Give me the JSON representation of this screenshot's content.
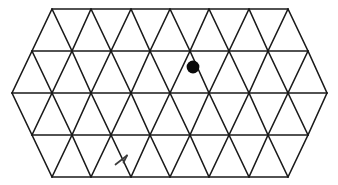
{
  "figure": {
    "background_color": "#ffffff",
    "line_color": "#1a1a1a",
    "line_width": 1.6,
    "marker_color": "#000000",
    "annotation_color": "#3a3a3a"
  },
  "geometry": {
    "width": 338,
    "height": 185,
    "rows": 4,
    "cell_width": 39.3,
    "row_height": 42,
    "left_apex_x": 12,
    "right_apex_x": 327,
    "top_y": 9,
    "bottom_y": 177,
    "horizontal_lines_y": [
      9,
      51,
      93,
      135,
      177
    ],
    "row_left_x": [
      52,
      32,
      12,
      32,
      52
    ],
    "row_right_x": [
      288,
      308,
      327,
      308,
      288
    ]
  },
  "chart_data": {
    "type": "scatter",
    "xlabel": "",
    "ylabel": "",
    "xlim": [
      0,
      338
    ],
    "ylim": [
      185,
      0
    ],
    "grid": true,
    "legend": "none",
    "series": [
      {
        "name": "dot-marker",
        "label": "Filled circular marker inside a downward triangle",
        "x": [
          193
        ],
        "y": [
          67
        ],
        "radius": 6.5,
        "color": "#000000"
      },
      {
        "name": "arrow-annotation",
        "label": "Small handwritten arrow mark inside a lower-row triangle",
        "x": [
          122
        ],
        "y": [
          162
        ],
        "color": "#3a3a3a"
      }
    ],
    "horizontal_gridlines_y": [
      9,
      51,
      93,
      135,
      177
    ],
    "row_spans_x": [
      [
        52,
        288
      ],
      [
        32,
        308
      ],
      [
        12,
        327
      ],
      [
        32,
        308
      ],
      [
        52,
        288
      ]
    ]
  },
  "markers": {
    "dot": {
      "name": "filled-dot-marker",
      "cx": 193,
      "cy": 67,
      "r": 6.4,
      "color": "#0a0a0a"
    },
    "arrow": {
      "name": "arrow-annotation",
      "x": 122,
      "y": 161,
      "color": "#3c3c3c"
    }
  },
  "artifacts": {
    "corner_smudge_label": "scan-artifact-top-left"
  }
}
